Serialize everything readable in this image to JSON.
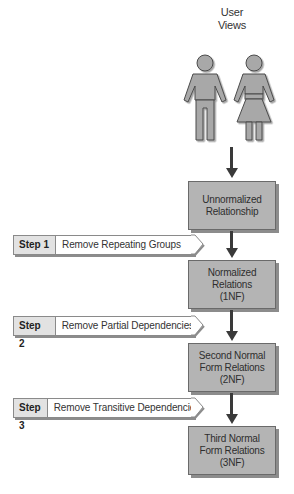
{
  "diagram": {
    "title_lines": [
      "User",
      "Views"
    ],
    "figures": [
      {
        "name": "man",
        "icon": "man-icon"
      },
      {
        "name": "woman",
        "icon": "woman-icon"
      }
    ],
    "nodes": [
      {
        "id": "unnormalized",
        "lines": [
          "Unnormalized",
          "Relationship"
        ]
      },
      {
        "id": "1nf",
        "lines": [
          "Normalized",
          "Relations",
          "(1NF)"
        ]
      },
      {
        "id": "2nf",
        "lines": [
          "Second Normal",
          "Form Relations",
          "(2NF)"
        ]
      },
      {
        "id": "3nf",
        "lines": [
          "Third Normal",
          "Form Relations",
          "(3NF)"
        ]
      }
    ],
    "steps": [
      {
        "number": "Step 1",
        "label": "Remove Repeating Groups"
      },
      {
        "number": "Step 2",
        "label": "Remove Partial Dependencies"
      },
      {
        "number": "Step 3",
        "label": "Remove Transitive Dependencies"
      }
    ],
    "colors": {
      "box_fill": "#b4b4b4",
      "figure_fill": "#a8a8a8",
      "arrow": "#3a3a3a",
      "step_number_fill": "#e2e2e2"
    }
  }
}
